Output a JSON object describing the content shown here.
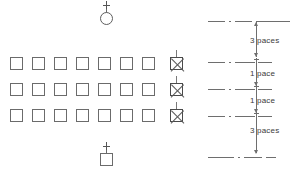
{
  "figure": {
    "line_color": "#6e6e6e",
    "text_color": "#3a3a3a",
    "background": "#ffffff"
  },
  "top_symbol": {
    "name": "circle-with-cross",
    "shape": "circle",
    "marker": "+"
  },
  "bottom_symbol": {
    "name": "square-with-cross",
    "shape": "square",
    "marker": "+"
  },
  "formation": {
    "rows": 3,
    "columns": 8,
    "plain_per_row": 7,
    "marked_per_row": 1,
    "marked_column_index": 7,
    "cell": {
      "open": "open-square",
      "marked": "crossed-square"
    },
    "grid": [
      [
        "open",
        "open",
        "open",
        "open",
        "open",
        "open",
        "open",
        "marked"
      ],
      [
        "open",
        "open",
        "open",
        "open",
        "open",
        "open",
        "open",
        "marked"
      ],
      [
        "open",
        "open",
        "open",
        "open",
        "open",
        "open",
        "open",
        "marked"
      ]
    ]
  },
  "scale": {
    "name": "pace-dimension-scale",
    "segments": [
      {
        "id": "seg-top",
        "label": "3 paces"
      },
      {
        "id": "seg-mid-1",
        "label": "1 pace"
      },
      {
        "id": "seg-mid-2",
        "label": "1 pace"
      },
      {
        "id": "seg-bottom",
        "label": "3 paces"
      }
    ],
    "reference_lines": 5,
    "line_style": "dash-dot"
  }
}
